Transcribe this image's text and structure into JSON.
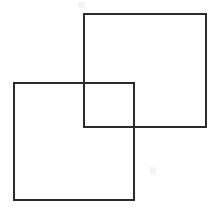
{
  "figure": {
    "canvas": {
      "width": 218,
      "height": 213,
      "background_color": "#ffffff"
    },
    "style": {
      "stroke_color": "#2b2b2b",
      "stroke_width": 2,
      "fill": "none"
    },
    "shapes": [
      {
        "name": "upper-right-square",
        "type": "square",
        "x": 84,
        "y": 14,
        "width": 122,
        "height": 113,
        "points": "84,14 206,14 206,127 84,127",
        "corners": {
          "top_left": [
            84,
            14
          ],
          "top_right": [
            206,
            14
          ],
          "bottom_right": [
            206,
            127
          ],
          "bottom_left": [
            84,
            127
          ]
        }
      },
      {
        "name": "lower-left-square",
        "type": "square",
        "x": 14,
        "y": 83,
        "width": 120,
        "height": 117,
        "points": "14,83 134,83 134,200 14,200",
        "corners": {
          "top_left": [
            14,
            83
          ],
          "top_right": [
            134,
            83
          ],
          "bottom_right": [
            134,
            200
          ],
          "bottom_left": [
            14,
            200
          ]
        }
      }
    ],
    "overlap_region": {
      "name": "intersection-rectangle",
      "x": 84,
      "y": 83,
      "width": 50,
      "height": 44,
      "occluded": false
    },
    "artifacts": [
      {
        "name": "faint-smudge-lower-right",
        "x": 150,
        "y": 167,
        "width": 6,
        "height": 8
      },
      {
        "name": "faint-smudge-top-left",
        "x": 78,
        "y": 2,
        "width": 7,
        "height": 6
      }
    ]
  }
}
